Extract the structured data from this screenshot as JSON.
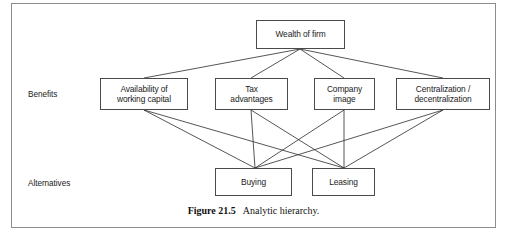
{
  "figure": {
    "caption_number": "Figure 21.5",
    "caption_text": "Analytic hierarchy.",
    "border_color": "#8c8c8c",
    "node_border_color": "#4a4a4a",
    "line_color": "#2b2b2b",
    "background": "#ffffff"
  },
  "row_labels": [
    {
      "id": "benefits",
      "label": "Benefits"
    },
    {
      "id": "alternatives",
      "label": "Alternatives"
    }
  ],
  "diagram_data": {
    "type": "hierarchy",
    "levels": [
      {
        "name": "goal",
        "nodes": [
          {
            "id": "wealth",
            "label": "Wealth of firm",
            "x": 256,
            "y": 20,
            "w": 89,
            "h": 29
          }
        ]
      },
      {
        "name": "benefits",
        "nodes": [
          {
            "id": "availability",
            "label": "Availability of\nworking capital",
            "line1": "Availability of",
            "line2": "working capital",
            "x": 100,
            "y": 78,
            "w": 88,
            "h": 32
          },
          {
            "id": "tax",
            "label": "Tax\nadvantages",
            "line1": "Tax",
            "line2": "advantages",
            "x": 215,
            "y": 78,
            "w": 73,
            "h": 32
          },
          {
            "id": "image",
            "label": "Company\nimage",
            "line1": "Company",
            "line2": "image",
            "x": 314,
            "y": 78,
            "w": 61,
            "h": 32
          },
          {
            "id": "centralization",
            "label": "Centralization /\ndecentralization",
            "line1": "Centralization /",
            "line2": "decentralization",
            "x": 396,
            "y": 78,
            "w": 94,
            "h": 32
          }
        ]
      },
      {
        "name": "alternatives",
        "nodes": [
          {
            "id": "buying",
            "label": "Buying",
            "x": 215,
            "y": 168,
            "w": 77,
            "h": 28
          },
          {
            "id": "leasing",
            "label": "Leasing",
            "x": 312,
            "y": 168,
            "w": 63,
            "h": 28
          }
        ]
      }
    ],
    "edges": [
      {
        "from": "wealth",
        "to": "availability"
      },
      {
        "from": "wealth",
        "to": "tax"
      },
      {
        "from": "wealth",
        "to": "image"
      },
      {
        "from": "wealth",
        "to": "centralization"
      },
      {
        "from": "availability",
        "to": "buying"
      },
      {
        "from": "availability",
        "to": "leasing"
      },
      {
        "from": "tax",
        "to": "buying"
      },
      {
        "from": "tax",
        "to": "leasing"
      },
      {
        "from": "image",
        "to": "buying"
      },
      {
        "from": "image",
        "to": "leasing"
      },
      {
        "from": "centralization",
        "to": "buying"
      },
      {
        "from": "centralization",
        "to": "leasing"
      }
    ]
  }
}
